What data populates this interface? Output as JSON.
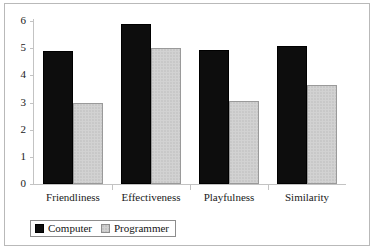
{
  "chart_data": {
    "type": "bar",
    "title": "",
    "subtitle": "",
    "xlabel": "",
    "ylabel": "",
    "ylim": [
      0,
      6
    ],
    "yticks": [
      0,
      1,
      2,
      3,
      4,
      5,
      6
    ],
    "ytick_labels": [
      "0",
      "1",
      "2",
      "3",
      "4",
      "5",
      "6"
    ],
    "grid": false,
    "legend_position": "bottom-left",
    "categories": [
      "Friendliness",
      "Effectiveness",
      "Playfulness",
      "Similarity"
    ],
    "series": [
      {
        "name": "Computer",
        "color": "#0d0d0d",
        "values": [
          4.9,
          5.9,
          4.93,
          5.07
        ]
      },
      {
        "name": "Programmer",
        "color": "#d2d2d2",
        "values": [
          3.0,
          5.0,
          3.05,
          3.65
        ]
      }
    ]
  },
  "legend": {
    "entries": [
      {
        "label": "Computer",
        "swatch": "computer"
      },
      {
        "label": "Programmer",
        "swatch": "programmer"
      }
    ]
  },
  "axis": {
    "y_labels": [
      "6",
      "5",
      "4",
      "3",
      "2",
      "1",
      "0"
    ]
  },
  "categories": {
    "items": [
      "Friendliness",
      "Effectiveness",
      "Playfulness",
      "Similarity"
    ]
  }
}
